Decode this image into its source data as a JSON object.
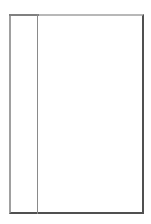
{
  "figure": {
    "shape": "book-outline",
    "colors": {
      "background": "#ffffff",
      "top_border": "#b8b8b8",
      "left_border": "#a0a0a0",
      "right_bottom_border": "#505050",
      "divider": "#8a8a8a"
    }
  }
}
